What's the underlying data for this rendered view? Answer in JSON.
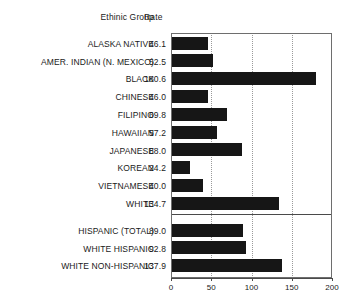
{
  "chart_data": {
    "type": "bar",
    "orientation": "horizontal",
    "title": "",
    "xlabel": "",
    "ylabel": "",
    "xlim": [
      0,
      200
    ],
    "xticks": [
      0,
      50,
      100,
      150,
      200
    ],
    "grid": true,
    "grid_axis": "x",
    "legend": false,
    "columns": [
      "Ethinic Group",
      "Rate"
    ],
    "categories": [
      "ALASKA NATIVE",
      "AMER. INDIAN (N. MEXICO)",
      "BLACK",
      "CHINESE",
      "FILIPINO",
      "HAWAIIAN",
      "JAPANESE",
      "KOREAN",
      "VIETNAMESE",
      "WHITE",
      "HISPANIC (TOTAL)",
      "WHITE HISPANIC",
      "WHITE NON-HISPANIC"
    ],
    "values": [
      46.1,
      52.5,
      180.6,
      46.0,
      69.8,
      57.2,
      88.0,
      24.2,
      40.0,
      134.7,
      89.0,
      92.8,
      137.9
    ],
    "value_labels": [
      "46.1",
      "52.5",
      "180.6",
      "46.0",
      "69.8",
      "57.2",
      "88.0",
      "24.2",
      "40.0",
      "134.7",
      "89.0",
      "92.8",
      "137.9"
    ],
    "group_break_after_index": 9,
    "bar_color": "#161616",
    "grid_color": "#9a9a9a",
    "axis_color": "#4a4a4a"
  },
  "header": {
    "group_label": "Ethinic Group",
    "rate_label": "Rate"
  },
  "rows": [
    {
      "label": "ALASKA NATIVE",
      "value": "46.1",
      "num": 46.1
    },
    {
      "label": "AMER. INDIAN (N. MEXICO)",
      "value": "52.5",
      "num": 52.5
    },
    {
      "label": "BLACK",
      "value": "180.6",
      "num": 180.6
    },
    {
      "label": "CHINESE",
      "value": "46.0",
      "num": 46.0
    },
    {
      "label": "FILIPINO",
      "value": "69.8",
      "num": 69.8
    },
    {
      "label": "HAWAIIAN",
      "value": "57.2",
      "num": 57.2
    },
    {
      "label": "JAPANESE",
      "value": "88.0",
      "num": 88.0
    },
    {
      "label": "KOREAN",
      "value": "24.2",
      "num": 24.2
    },
    {
      "label": "VIETNAMESE",
      "value": "40.0",
      "num": 40.0
    },
    {
      "label": "WHITE",
      "value": "134.7",
      "num": 134.7
    },
    {
      "label": "HISPANIC (TOTAL)",
      "value": "89.0",
      "num": 89.0
    },
    {
      "label": "WHITE HISPANIC",
      "value": "92.8",
      "num": 92.8
    },
    {
      "label": "WHITE NON-HISPANIC",
      "value": "137.9",
      "num": 137.9
    }
  ],
  "axis": {
    "ticks": [
      "0",
      "50",
      "100",
      "150",
      "200"
    ],
    "tick_values": [
      0,
      50,
      100,
      150,
      200
    ]
  }
}
